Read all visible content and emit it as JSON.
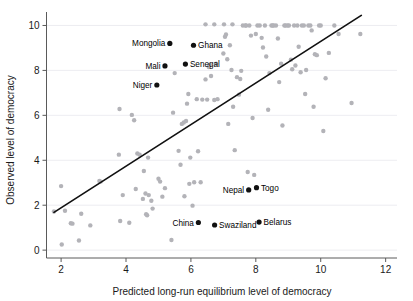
{
  "chart_data": {
    "type": "scatter",
    "title": "",
    "xlabel": "Predicted long-run equilibrium level of democracy",
    "ylabel": "Observed level of democracy",
    "xlim": [
      1.55,
      12.35
    ],
    "ylim": [
      -0.35,
      10.6
    ],
    "xticks": [
      2,
      4,
      6,
      8,
      10,
      12
    ],
    "yticks": [
      0,
      2,
      4,
      6,
      8,
      10
    ],
    "grid": true,
    "grid_axis": "y",
    "legend": "none",
    "fit_line": {
      "label": "45-degree / regression line",
      "x": [
        1.78,
        11.25
      ],
      "y": [
        1.68,
        10.45
      ]
    },
    "highlighted_points": [
      {
        "name": "Mongolia",
        "x": 5.35,
        "y": 9.2,
        "label_side": "left"
      },
      {
        "name": "Ghana",
        "x": 6.08,
        "y": 9.12,
        "label_side": "right"
      },
      {
        "name": "Mali",
        "x": 5.2,
        "y": 8.2,
        "label_side": "left"
      },
      {
        "name": "Senegal",
        "x": 5.83,
        "y": 8.28,
        "label_side": "right"
      },
      {
        "name": "Niger",
        "x": 4.95,
        "y": 7.35,
        "label_side": "left"
      },
      {
        "name": "Nepal",
        "x": 7.78,
        "y": 2.68,
        "label_side": "left"
      },
      {
        "name": "Togo",
        "x": 8.02,
        "y": 2.78,
        "label_side": "right"
      },
      {
        "name": "China",
        "x": 6.23,
        "y": 1.23,
        "label_side": "left"
      },
      {
        "name": "Swaziland",
        "x": 6.73,
        "y": 1.12,
        "label_side": "right"
      },
      {
        "name": "Belarus",
        "x": 8.1,
        "y": 1.25,
        "label_side": "right"
      }
    ],
    "background_points": [
      [
        1.78,
        1.72
      ],
      [
        2.0,
        2.85
      ],
      [
        2.02,
        0.25
      ],
      [
        2.12,
        1.75
      ],
      [
        2.3,
        1.2
      ],
      [
        2.35,
        1.18
      ],
      [
        2.55,
        0.43
      ],
      [
        2.62,
        1.62
      ],
      [
        2.9,
        1.1
      ],
      [
        3.18,
        3.08
      ],
      [
        3.22,
        3.05
      ],
      [
        3.78,
        4.25
      ],
      [
        3.8,
        6.28
      ],
      [
        3.82,
        1.3
      ],
      [
        3.9,
        2.45
      ],
      [
        4.1,
        1.22
      ],
      [
        4.18,
        6.02
      ],
      [
        4.25,
        5.78
      ],
      [
        4.3,
        2.72
      ],
      [
        4.35,
        4.3
      ],
      [
        4.42,
        4.25
      ],
      [
        4.52,
        2.28
      ],
      [
        4.55,
        3.52
      ],
      [
        4.6,
        2.52
      ],
      [
        4.62,
        1.6
      ],
      [
        4.65,
        1.55
      ],
      [
        4.68,
        4.12
      ],
      [
        4.7,
        2.45
      ],
      [
        4.78,
        2.2
      ],
      [
        4.82,
        1.85
      ],
      [
        5.0,
        3.18
      ],
      [
        5.05,
        3.05
      ],
      [
        5.12,
        2.38
      ],
      [
        5.2,
        2.76
      ],
      [
        5.4,
        0.45
      ],
      [
        5.45,
        6.12
      ],
      [
        5.5,
        7.88
      ],
      [
        5.62,
        4.42
      ],
      [
        5.68,
        3.8
      ],
      [
        5.72,
        5.62
      ],
      [
        5.78,
        5.68
      ],
      [
        5.8,
        2.4
      ],
      [
        5.85,
        5.75
      ],
      [
        5.88,
        6.52
      ],
      [
        5.92,
        6.95
      ],
      [
        5.95,
        2.95
      ],
      [
        5.98,
        4.12
      ],
      [
        6.05,
        1.98
      ],
      [
        6.1,
        3.02
      ],
      [
        6.18,
        6.72
      ],
      [
        6.22,
        4.4
      ],
      [
        6.3,
        3.02
      ],
      [
        6.35,
        6.7
      ],
      [
        6.45,
        7.6
      ],
      [
        6.5,
        6.7
      ],
      [
        6.55,
        8.15
      ],
      [
        6.58,
        8.25
      ],
      [
        6.62,
        7.75
      ],
      [
        6.72,
        6.68
      ],
      [
        6.78,
        8.3
      ],
      [
        6.82,
        6.72
      ],
      [
        7.0,
        8.75
      ],
      [
        7.05,
        9.5
      ],
      [
        7.08,
        9.6
      ],
      [
        7.12,
        8.5
      ],
      [
        7.15,
        5.62
      ],
      [
        7.2,
        9.12
      ],
      [
        7.25,
        8.02
      ],
      [
        7.3,
        6.38
      ],
      [
        7.35,
        4.45
      ],
      [
        7.42,
        7.7
      ],
      [
        7.48,
        6.92
      ],
      [
        7.52,
        7.62
      ],
      [
        7.55,
        7.98
      ],
      [
        7.6,
        10.0
      ],
      [
        7.68,
        10.0
      ],
      [
        7.7,
        10.0
      ],
      [
        7.75,
        3.48
      ],
      [
        7.8,
        10.0
      ],
      [
        7.85,
        9.55
      ],
      [
        7.9,
        5.88
      ],
      [
        7.95,
        3.35
      ],
      [
        8.0,
        9.62
      ],
      [
        8.05,
        10.0
      ],
      [
        8.12,
        10.0
      ],
      [
        8.18,
        9.45
      ],
      [
        8.22,
        9.02
      ],
      [
        8.28,
        10.0
      ],
      [
        8.32,
        8.62
      ],
      [
        8.38,
        6.25
      ],
      [
        8.42,
        7.88
      ],
      [
        8.48,
        10.0
      ],
      [
        8.52,
        10.0
      ],
      [
        8.55,
        10.0
      ],
      [
        8.62,
        10.0
      ],
      [
        8.68,
        9.42
      ],
      [
        8.72,
        7.48
      ],
      [
        8.78,
        8.3
      ],
      [
        8.82,
        5.55
      ],
      [
        8.88,
        10.0
      ],
      [
        8.92,
        10.0
      ],
      [
        8.98,
        10.0
      ],
      [
        9.02,
        10.0
      ],
      [
        9.08,
        8.48
      ],
      [
        9.12,
        8.05
      ],
      [
        9.18,
        10.0
      ],
      [
        9.22,
        8.22
      ],
      [
        9.28,
        10.0
      ],
      [
        9.32,
        9.05
      ],
      [
        9.38,
        7.92
      ],
      [
        9.42,
        10.0
      ],
      [
        9.48,
        10.0
      ],
      [
        9.52,
        6.95
      ],
      [
        9.55,
        8.02
      ],
      [
        9.62,
        10.0
      ],
      [
        9.68,
        10.0
      ],
      [
        9.72,
        9.78
      ],
      [
        9.78,
        6.38
      ],
      [
        9.82,
        8.72
      ],
      [
        9.88,
        8.68
      ],
      [
        9.95,
        10.0
      ],
      [
        10.0,
        10.0
      ],
      [
        10.08,
        5.3
      ],
      [
        10.15,
        7.65
      ],
      [
        10.25,
        8.78
      ],
      [
        10.42,
        10.0
      ],
      [
        10.55,
        9.62
      ],
      [
        10.95,
        6.55
      ],
      [
        11.22,
        9.62
      ],
      [
        6.45,
        10.05
      ],
      [
        6.72,
        10.05
      ],
      [
        7.02,
        10.05
      ],
      [
        7.28,
        10.05
      ]
    ],
    "marker": {
      "background_color": "#b3b3b8",
      "highlight_color": "#111111",
      "background_radius": 2.2,
      "highlight_radius": 2.6
    }
  }
}
